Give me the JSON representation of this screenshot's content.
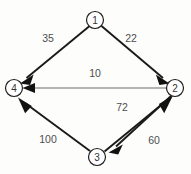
{
  "figure": {
    "title": "",
    "background_color": "#fdfdfc",
    "width": 191,
    "height": 174
  },
  "diagram": {
    "type": "directed-weighted-graph",
    "nodes": [
      {
        "id": "1",
        "label": "1",
        "x": 95,
        "y": 20,
        "r": 8.5
      },
      {
        "id": "4",
        "label": "4",
        "x": 14,
        "y": 88,
        "r": 8.5
      },
      {
        "id": "2",
        "label": "2",
        "x": 175,
        "y": 88,
        "r": 8.5
      },
      {
        "id": "3",
        "label": "3",
        "x": 97,
        "y": 157,
        "r": 8.5
      }
    ],
    "edges": [
      {
        "id": "e1-4",
        "from": "1",
        "to": "4",
        "weight": "35",
        "style": "thick",
        "label_x": 48,
        "label_y": 38
      },
      {
        "id": "e1-2",
        "from": "1",
        "to": "2",
        "weight": "22",
        "style": "thick",
        "label_x": 131,
        "label_y": 38
      },
      {
        "id": "e2-4",
        "from": "2",
        "to": "4",
        "weight": "10",
        "style": "thin",
        "label_x": 95,
        "label_y": 73
      },
      {
        "id": "e2-3",
        "from": "2",
        "to": "3",
        "weight": "72",
        "style": "thick",
        "label_x": 122,
        "label_y": 107
      },
      {
        "id": "e3-2",
        "from": "3",
        "to": "2",
        "weight": "60",
        "style": "thick",
        "label_x": 154,
        "label_y": 140
      },
      {
        "id": "e3-4",
        "from": "3",
        "to": "4",
        "weight": "100",
        "style": "thick",
        "label_x": 48,
        "label_y": 139
      }
    ],
    "colors": {
      "node_stroke": "#1c1c1c",
      "node_fill": "#ffffff",
      "node_label": "#333333",
      "edge_thick": "#1a1a1a",
      "edge_thin": "#6b6b6b",
      "weight_text": "#4d4d4d",
      "arrow_fill": "#111111"
    }
  }
}
